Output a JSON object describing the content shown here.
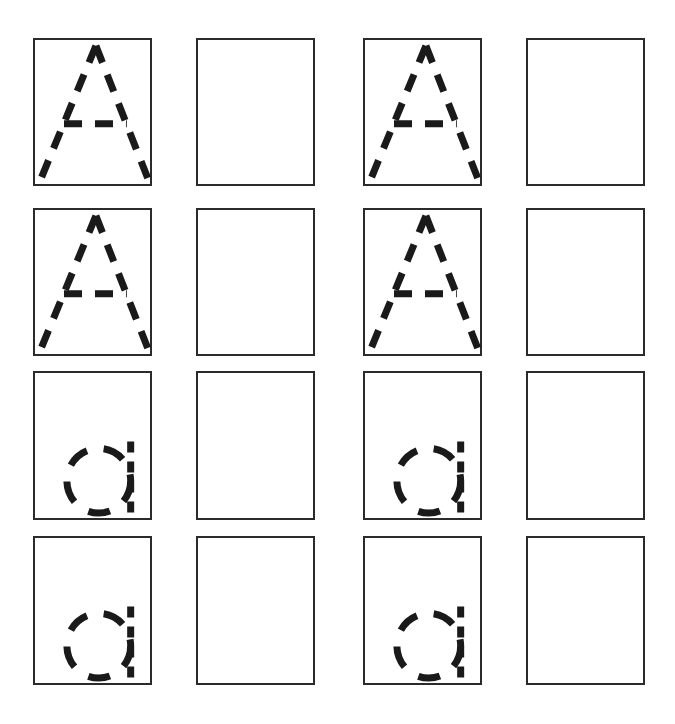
{
  "worksheet": {
    "title": "Letter Tracing Practice Worksheet",
    "page_width": 675,
    "page_height": 724,
    "background_color": "#ffffff",
    "stroke_color": "#1a1a1a",
    "border_color": "#2b2b2b",
    "border_width_px": 2,
    "columns": 4,
    "rows": 4,
    "column_lefts": [
      33,
      196,
      363,
      526
    ],
    "row_tops": [
      38,
      208,
      371,
      536
    ],
    "cell_width": 119,
    "cell_height": 148,
    "cell_height_last_rows": 149
  },
  "legend": {
    "guide_column_label": "Traceable dashed letter guide",
    "practice_column_label": "Blank practice box"
  },
  "cells": [
    {
      "row": 1,
      "col": 1,
      "name": "cell-r1c1",
      "kind": "guide",
      "glyph": "A",
      "glyph_case": "uppercase",
      "label": "Uppercase A tracing guide"
    },
    {
      "row": 1,
      "col": 2,
      "name": "cell-r1c2",
      "kind": "practice",
      "glyph": "",
      "glyph_case": "",
      "label": "Blank practice box"
    },
    {
      "row": 1,
      "col": 3,
      "name": "cell-r1c3",
      "kind": "guide",
      "glyph": "A",
      "glyph_case": "uppercase",
      "label": "Uppercase A tracing guide"
    },
    {
      "row": 1,
      "col": 4,
      "name": "cell-r1c4",
      "kind": "practice",
      "glyph": "",
      "glyph_case": "",
      "label": "Blank practice box"
    },
    {
      "row": 2,
      "col": 1,
      "name": "cell-r2c1",
      "kind": "guide",
      "glyph": "A",
      "glyph_case": "uppercase",
      "label": "Uppercase A tracing guide"
    },
    {
      "row": 2,
      "col": 2,
      "name": "cell-r2c2",
      "kind": "practice",
      "glyph": "",
      "glyph_case": "",
      "label": "Blank practice box"
    },
    {
      "row": 2,
      "col": 3,
      "name": "cell-r2c3",
      "kind": "guide",
      "glyph": "A",
      "glyph_case": "uppercase",
      "label": "Uppercase A tracing guide"
    },
    {
      "row": 2,
      "col": 4,
      "name": "cell-r2c4",
      "kind": "practice",
      "glyph": "",
      "glyph_case": "",
      "label": "Blank practice box"
    },
    {
      "row": 3,
      "col": 1,
      "name": "cell-r3c1",
      "kind": "guide",
      "glyph": "a",
      "glyph_case": "lowercase",
      "label": "Lowercase a tracing guide"
    },
    {
      "row": 3,
      "col": 2,
      "name": "cell-r3c2",
      "kind": "practice",
      "glyph": "",
      "glyph_case": "",
      "label": "Blank practice box"
    },
    {
      "row": 3,
      "col": 3,
      "name": "cell-r3c3",
      "kind": "guide",
      "glyph": "a",
      "glyph_case": "lowercase",
      "label": "Lowercase a tracing guide"
    },
    {
      "row": 3,
      "col": 4,
      "name": "cell-r3c4",
      "kind": "practice",
      "glyph": "",
      "glyph_case": "",
      "label": "Blank practice box"
    },
    {
      "row": 4,
      "col": 1,
      "name": "cell-r4c1",
      "kind": "guide",
      "glyph": "a",
      "glyph_case": "lowercase",
      "label": "Lowercase a tracing guide"
    },
    {
      "row": 4,
      "col": 2,
      "name": "cell-r4c2",
      "kind": "practice",
      "glyph": "",
      "glyph_case": "",
      "label": "Blank practice box"
    },
    {
      "row": 4,
      "col": 3,
      "name": "cell-r4c3",
      "kind": "guide",
      "glyph": "a",
      "glyph_case": "lowercase",
      "label": "Lowercase a tracing guide"
    },
    {
      "row": 4,
      "col": 4,
      "name": "cell-r4c4",
      "kind": "practice",
      "glyph": "",
      "glyph_case": "",
      "label": "Blank practice box"
    }
  ],
  "glyph_geometry": {
    "uppercase_A": {
      "viewbox": "0 0 119 148",
      "stroke_width": 7,
      "dash_pattern": "18 13",
      "apex": [
        63,
        6
      ],
      "left_foot": [
        6,
        143
      ],
      "right_foot": [
        117,
        143
      ],
      "crossbar_y": 86,
      "crossbar_left_x": 30,
      "crossbar_right_x": 95,
      "strokes": [
        {
          "name": "left-diagonal",
          "from": [
            63,
            6
          ],
          "to": [
            6,
            143
          ]
        },
        {
          "name": "right-diagonal",
          "from": [
            63,
            6
          ],
          "to": [
            117,
            143
          ]
        },
        {
          "name": "crossbar",
          "from": [
            30,
            86
          ],
          "to": [
            95,
            86
          ]
        }
      ]
    },
    "lowercase_a": {
      "viewbox": "0 0 119 148",
      "stroke_width": 7,
      "bowl_dash_pattern": "22 17",
      "stem_dash_pattern": "11 9",
      "bowl_center": [
        66,
        110
      ],
      "bowl_radius": 33,
      "stem_x": 99,
      "stem_top_y": 70,
      "stem_bottom_y": 146,
      "strokes": [
        {
          "name": "bowl",
          "shape": "circle",
          "center": [
            66,
            110
          ],
          "radius": 33
        },
        {
          "name": "stem",
          "shape": "line",
          "from": [
            99,
            70
          ],
          "to": [
            99,
            146
          ]
        }
      ]
    }
  }
}
